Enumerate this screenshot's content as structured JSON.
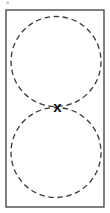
{
  "figure": {
    "canvas": {
      "width": 110,
      "height": 213,
      "background_color": "#ffffff"
    },
    "frame": {
      "name": "border-rectangle",
      "x": 6,
      "y": 10,
      "width": 98,
      "height": 197,
      "stroke_color": "#4a4a4a",
      "stroke_width": 1.4,
      "fill": "none"
    },
    "circles": [
      {
        "name": "upper-circle",
        "center_x": 56,
        "center_y": 61.5,
        "radius": 45,
        "stroke_color": "#3a3a3a",
        "stroke_width": 1.3,
        "dash_length": 5.5,
        "gap_length": 3.6,
        "style": "dashed"
      },
      {
        "name": "lower-circle",
        "center_x": 56,
        "center_y": 152.5,
        "radius": 45,
        "stroke_color": "#3a3a3a",
        "stroke_width": 1.3,
        "dash_length": 5.5,
        "gap_length": 3.6,
        "style": "dashed"
      }
    ],
    "tangent_point": {
      "name": "tangency-marker",
      "label": "x",
      "x": 57.5,
      "y": 106.5,
      "font_size": 15,
      "color": "#111111"
    },
    "specks": [
      {
        "name": "top-left-speck",
        "x": 6.5,
        "y": 1.5,
        "width": 2.5,
        "height": 2.5,
        "color": "#b0b0b0"
      }
    ]
  }
}
